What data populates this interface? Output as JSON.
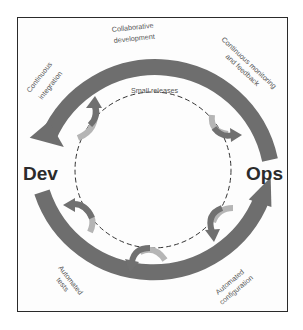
{
  "diagram": {
    "nodes": {
      "dev": "Dev",
      "ops": "Ops"
    },
    "outer_labels": {
      "top_center_line1": "Collaborative",
      "top_center_line2": "development",
      "top_left_line1": "Continuous",
      "top_left_line2": "integration",
      "top_right_line1": "Continuous monitoring",
      "top_right_line2": "and feedback",
      "bottom_left_line1": "Automated",
      "bottom_left_line2": "tests",
      "bottom_right_line1": "Automated",
      "bottom_right_line2": "configuration"
    },
    "inner_label": "Small releases",
    "colors": {
      "arc": "#6e6e6e",
      "small_arrow_dark": "#707070",
      "small_arrow_light": "#b5b5b5",
      "frame": "#2a2a2a",
      "text": "#555555",
      "node_text": "#2b2b2b"
    }
  }
}
